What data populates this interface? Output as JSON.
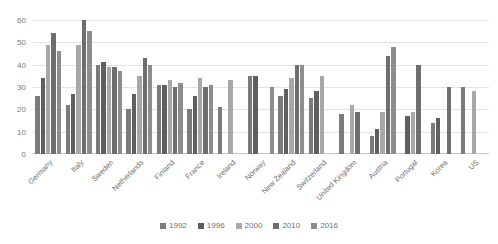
{
  "chart_data": {
    "type": "bar",
    "title": "",
    "xlabel": "",
    "ylabel": "",
    "ylim": [
      0,
      60
    ],
    "yticks": [
      0,
      10,
      20,
      30,
      40,
      50,
      60
    ],
    "grid": true,
    "legend_position": "bottom",
    "categories": [
      "Germany",
      "Italy",
      "Sweden",
      "Netherlands",
      "Finland",
      "France",
      "Ireland",
      "Norway",
      "New Zealand",
      "Switzerland",
      "United Kingdom",
      "Austria",
      "Portugal",
      "Korea",
      "US"
    ],
    "series": [
      {
        "name": "1992",
        "color": "#7b7b7b",
        "values": [
          26,
          22,
          40,
          20,
          31,
          20,
          21,
          35,
          26,
          25,
          18,
          8,
          null,
          14,
          30
        ]
      },
      {
        "name": "1996",
        "color": "#5f5f5f",
        "values": [
          34,
          27,
          41,
          27,
          31,
          26,
          null,
          35,
          29,
          28,
          null,
          11,
          17,
          16,
          null
        ]
      },
      {
        "name": "2000",
        "color": "#a8a8a8",
        "values": [
          49,
          49,
          39,
          35,
          33,
          34,
          33,
          null,
          34,
          35,
          22,
          19,
          19,
          null,
          28
        ]
      },
      {
        "name": "2010",
        "color": "#6e6e6e",
        "values": [
          54,
          60,
          39,
          43,
          30,
          30,
          null,
          null,
          40,
          null,
          19,
          44,
          40,
          30,
          null
        ]
      },
      {
        "name": "2016",
        "color": "#8d8d8d",
        "values": [
          46,
          55,
          37,
          40,
          32,
          31,
          null,
          30,
          40,
          null,
          null,
          48,
          null,
          null,
          null
        ]
      }
    ]
  }
}
